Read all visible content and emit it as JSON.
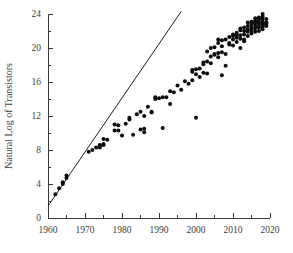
{
  "chart_data": {
    "type": "scatter",
    "title": "",
    "xlabel": "",
    "ylabel": "Natural Log of Transistors",
    "xlim": [
      1960,
      2020
    ],
    "ylim": [
      0,
      24
    ],
    "grid": false,
    "legend": null,
    "x_ticks_major": [
      1960,
      1970,
      1980,
      1990,
      2000,
      2010,
      2020
    ],
    "x_tick_labels": [
      "1960",
      "1970",
      "1980",
      "1990",
      "2000",
      "2010",
      "2020"
    ],
    "x_ticks_minor": [
      1965,
      1975,
      1985,
      1995,
      2005,
      2015
    ],
    "y_ticks_major": [
      0,
      4,
      8,
      12,
      16,
      20,
      24
    ],
    "y_tick_labels": [
      "0",
      "4",
      "8",
      "12",
      "16",
      "20",
      "24"
    ],
    "y_ticks_minor": [
      2,
      6,
      10,
      14,
      18,
      22
    ],
    "series": [
      {
        "name": "Natural log of transistor count",
        "marker": "filled-circle",
        "color": "#0c0c0c",
        "points": [
          [
            1962,
            2.8
          ],
          [
            1963,
            3.5
          ],
          [
            1964,
            4.0
          ],
          [
            1964,
            4.2
          ],
          [
            1965,
            4.7
          ],
          [
            1965,
            5.0
          ],
          [
            1971,
            7.8
          ],
          [
            1972,
            8.0
          ],
          [
            1973,
            8.3
          ],
          [
            1974,
            8.5
          ],
          [
            1974,
            8.6
          ],
          [
            1974,
            8.3
          ],
          [
            1975,
            8.6
          ],
          [
            1975,
            8.7
          ],
          [
            1975,
            9.3
          ],
          [
            1976,
            9.2
          ],
          [
            1978,
            10.3
          ],
          [
            1978,
            11.0
          ],
          [
            1979,
            10.9
          ],
          [
            1979,
            10.3
          ],
          [
            1980,
            9.7
          ],
          [
            1981,
            11.1
          ],
          [
            1982,
            11.8
          ],
          [
            1982,
            11.6
          ],
          [
            1983,
            9.8
          ],
          [
            1984,
            12.2
          ],
          [
            1985,
            12.5
          ],
          [
            1985,
            10.4
          ],
          [
            1986,
            10.5
          ],
          [
            1986,
            10.1
          ],
          [
            1986,
            12.0
          ],
          [
            1987,
            13.1
          ],
          [
            1988,
            12.5
          ],
          [
            1988,
            12.4
          ],
          [
            1989,
            14.0
          ],
          [
            1989,
            14.2
          ],
          [
            1990,
            14.1
          ],
          [
            1991,
            14.2
          ],
          [
            1991,
            10.6
          ],
          [
            1992,
            14.2
          ],
          [
            1993,
            13.4
          ],
          [
            1993,
            14.9
          ],
          [
            1994,
            14.8
          ],
          [
            1995,
            15.6
          ],
          [
            1996,
            15.1
          ],
          [
            1997,
            16.1
          ],
          [
            1998,
            15.8
          ],
          [
            1999,
            16.2
          ],
          [
            1999,
            17.2
          ],
          [
            1999,
            17.4
          ],
          [
            2000,
            11.8
          ],
          [
            2000,
            16.9
          ],
          [
            2000,
            17.5
          ],
          [
            2001,
            17.6
          ],
          [
            2002,
            18.1
          ],
          [
            2002,
            18.3
          ],
          [
            2003,
            18.4
          ],
          [
            2003,
            19.6
          ],
          [
            2004,
            19.0
          ],
          [
            2004,
            20.0
          ],
          [
            2005,
            19.2
          ],
          [
            2005,
            19.3
          ],
          [
            2006,
            19.4
          ],
          [
            2006,
            20.6
          ],
          [
            2006,
            21.0
          ],
          [
            2007,
            19.5
          ],
          [
            2007,
            16.8
          ],
          [
            2007,
            20.9
          ],
          [
            2008,
            19.3
          ],
          [
            2008,
            21.0
          ],
          [
            2008,
            17.9
          ],
          [
            2009,
            20.6
          ],
          [
            2009,
            21.3
          ],
          [
            2010,
            21.0
          ],
          [
            2010,
            21.4
          ],
          [
            2010,
            21.6
          ],
          [
            2011,
            21.2
          ],
          [
            2011,
            21.5
          ],
          [
            2011,
            21.8
          ],
          [
            2012,
            20.0
          ],
          [
            2012,
            21.5
          ],
          [
            2012,
            22.1
          ],
          [
            2012,
            22.3
          ],
          [
            2013,
            21.6
          ],
          [
            2013,
            22.0
          ],
          [
            2013,
            22.4
          ],
          [
            2014,
            21.9
          ],
          [
            2014,
            22.2
          ],
          [
            2014,
            22.6
          ],
          [
            2014,
            23.0
          ],
          [
            2015,
            22.1
          ],
          [
            2015,
            22.4
          ],
          [
            2015,
            22.8
          ],
          [
            2015,
            23.1
          ],
          [
            2016,
            22.3
          ],
          [
            2016,
            22.6
          ],
          [
            2016,
            22.9
          ],
          [
            2016,
            23.2
          ],
          [
            2016,
            23.5
          ],
          [
            2017,
            22.4
          ],
          [
            2017,
            22.7
          ],
          [
            2017,
            23.0
          ],
          [
            2017,
            23.3
          ],
          [
            2017,
            23.6
          ],
          [
            2018,
            22.5
          ],
          [
            2018,
            22.8
          ],
          [
            2018,
            23.1
          ],
          [
            2018,
            23.4
          ],
          [
            2018,
            24.0
          ],
          [
            2018,
            22.2
          ],
          [
            2019,
            22.7
          ],
          [
            2019,
            23.0
          ],
          [
            2019,
            22.9
          ],
          [
            2019,
            22.6
          ],
          [
            2013,
            21.0
          ],
          [
            2011,
            20.7
          ],
          [
            2009,
            20.4
          ],
          [
            2007,
            20.2
          ],
          [
            2005,
            20.1
          ],
          [
            2003,
            17.0
          ],
          [
            2001,
            16.6
          ],
          [
            2012,
            21.1
          ],
          [
            2014,
            21.4
          ],
          [
            2016,
            21.9
          ],
          [
            2017,
            22.0
          ],
          [
            2018,
            22.9
          ],
          [
            2015,
            21.7
          ],
          [
            2013,
            20.8
          ],
          [
            2010,
            20.3
          ],
          [
            2006,
            18.9
          ],
          [
            2004,
            18.2
          ],
          [
            2002,
            17.1
          ],
          [
            2019,
            23.4
          ],
          [
            2018,
            23.7
          ],
          [
            2017,
            23.4
          ],
          [
            2016,
            23.0
          ]
        ]
      }
    ],
    "fit_line": {
      "name": "Moore's Law reference line",
      "color": "#1d1d1d",
      "x_start": 1960,
      "y_start": 1.4,
      "x_end": 1996,
      "y_end": 24.3
    }
  },
  "caption": {
    "fragment": ""
  }
}
